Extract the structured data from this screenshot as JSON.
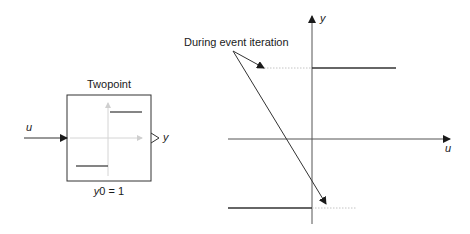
{
  "block": {
    "title": "Twopoint",
    "input_label": "u",
    "output_label": "y",
    "parameter": "y0 = 1"
  },
  "graph": {
    "x_axis_label": "u",
    "y_axis_label": "y",
    "annotation": "During event iteration"
  },
  "colors": {
    "line": "#333333",
    "axis": "#555555",
    "faint": "#c8c8c8",
    "dotted": "#bdbdbd"
  }
}
